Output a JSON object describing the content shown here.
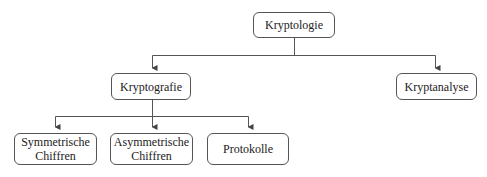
{
  "diagram": {
    "type": "tree",
    "root": "Kryptologie",
    "nodes": [
      {
        "id": "kryptologie",
        "label": "Kryptologie"
      },
      {
        "id": "kryptografie",
        "label": "Kryptografie"
      },
      {
        "id": "kryptanalyse",
        "label": "Kryptanalyse"
      },
      {
        "id": "symmetrische",
        "label": "Symmetrische\nChiffren"
      },
      {
        "id": "asymmetrische",
        "label": "Asymmetrische\nChiffren"
      },
      {
        "id": "protokolle",
        "label": "Protokolle"
      }
    ],
    "edges": [
      {
        "from": "kryptologie",
        "to": "kryptografie"
      },
      {
        "from": "kryptologie",
        "to": "kryptanalyse"
      },
      {
        "from": "kryptografie",
        "to": "symmetrische"
      },
      {
        "from": "kryptografie",
        "to": "asymmetrische"
      },
      {
        "from": "kryptografie",
        "to": "protokolle"
      }
    ],
    "colors": {
      "line": "#555555",
      "text": "#222222",
      "background": "#ffffff"
    }
  }
}
